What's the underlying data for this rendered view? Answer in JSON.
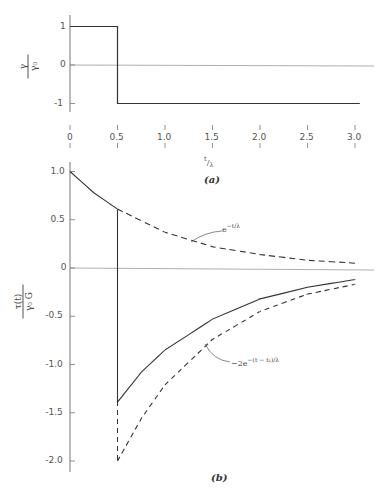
{
  "chart_data": [
    {
      "id": "a",
      "type": "line",
      "caption": "(a)",
      "title": "",
      "xlabel": "t/λ",
      "ylabel": {
        "num": "γ",
        "den": "γ₀"
      },
      "x_ticks": [
        "0",
        "0.5",
        "1.0",
        "1.5",
        "2.0",
        "2.5",
        "3.0"
      ],
      "x_tick_values": [
        0,
        0.5,
        1.0,
        1.5,
        2.0,
        2.5,
        3.0
      ],
      "y_ticks": [
        "1",
        "0",
        "-1"
      ],
      "y_tick_values": [
        1,
        0,
        -1
      ],
      "xlim": [
        0,
        3.05
      ],
      "ylim": [
        -1.2,
        1.2
      ],
      "grid": false,
      "series": [
        {
          "name": "step strain",
          "style": "solid",
          "x": [
            0,
            0.5,
            0.5,
            3.05
          ],
          "y": [
            1,
            1,
            -1,
            -1
          ]
        }
      ]
    },
    {
      "id": "b",
      "type": "line",
      "caption": "(b)",
      "title": "",
      "xlabel": "",
      "ylabel": {
        "num": "τ(t)",
        "den": "γ₀ G"
      },
      "y_ticks": [
        "1.0",
        "0.5",
        "0",
        "-0.5",
        "-1.0",
        "-1.5",
        "-2.0"
      ],
      "y_tick_values": [
        1.0,
        0.5,
        0,
        -0.5,
        -1.0,
        -1.5,
        -2.0
      ],
      "xlim": [
        0,
        3.0
      ],
      "ylim": [
        -2.1,
        1.1
      ],
      "grid": false,
      "series": [
        {
          "name": "e^{-t/λ}",
          "style": "solid-then-dashed",
          "x": [
            0,
            0.25,
            0.5,
            1.0,
            1.5,
            2.0,
            2.5,
            3.0
          ],
          "y": [
            1.0,
            0.78,
            0.61,
            0.37,
            0.22,
            0.14,
            0.08,
            0.05
          ]
        },
        {
          "name": "response",
          "style": "solid",
          "x": [
            0.5,
            0.5,
            0.75,
            1.0,
            1.5,
            2.0,
            2.5,
            3.0
          ],
          "y": [
            0.61,
            -1.39,
            -1.08,
            -0.85,
            -0.53,
            -0.32,
            -0.2,
            -0.12
          ]
        },
        {
          "name": "-2e^{-(t-t_1)/λ}",
          "style": "dashed",
          "x": [
            0.5,
            0.75,
            1.0,
            1.5,
            2.0,
            2.5,
            3.0
          ],
          "y": [
            -2.0,
            -1.56,
            -1.21,
            -0.74,
            -0.45,
            -0.27,
            -0.17
          ]
        }
      ],
      "annotations": [
        {
          "text": "e^{-t/λ}",
          "x": 1.75,
          "y": 0.35
        },
        {
          "text": "-2e^{-(t-t₁)/λ}",
          "x": 1.6,
          "y": -0.85
        }
      ]
    }
  ],
  "labels": {
    "a": {
      "caption": "(a)",
      "xlabel_num": "t",
      "xlabel_den": "λ",
      "y_num": "γ",
      "y_den": "γ₀",
      "xticks": [
        "0",
        "0.5",
        "1.0",
        "1.5",
        "2.0",
        "2.5",
        "3.0"
      ],
      "yticks": [
        "1",
        "0",
        "-1"
      ]
    },
    "b": {
      "caption": "(b)",
      "y_num": "τ(t)",
      "y_den": "γ₀ G",
      "yticks": [
        "1.0",
        "0.5",
        "0",
        "-0.5",
        "-1.0",
        "-1.5",
        "-2.0"
      ],
      "ann1_base": "e",
      "ann1_exp": "−t/λ",
      "ann2_base": "−2e",
      "ann2_exp": "−(t − t₁)/λ"
    }
  }
}
